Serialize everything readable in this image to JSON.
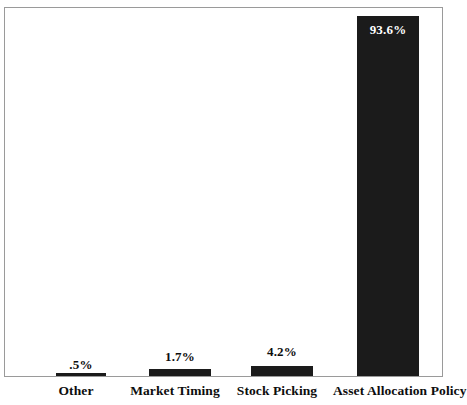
{
  "chart_data": {
    "type": "bar",
    "title": "",
    "subtitle": "",
    "xlabel": "",
    "ylabel": "",
    "grid": false,
    "legend": false,
    "ylim": [
      0,
      100
    ],
    "categories": [
      "Other",
      "Market Timing",
      "Stock Picking",
      "Asset Allocation Policy"
    ],
    "values": [
      0.5,
      1.7,
      4.2,
      93.6
    ],
    "data_labels": [
      ".5%",
      "1.7%",
      "4.2%",
      "93.6%"
    ],
    "series": [
      {
        "name": "Contribution to Return Variation",
        "values": [
          0.5,
          1.7,
          4.2,
          93.6
        ]
      }
    ],
    "bar_color": "#1b1b1b",
    "label_color_outside": "#0d0d0d",
    "label_color_inside": "#ffffff",
    "frame_color": "#9a9a9a",
    "background": "#ffffff"
  },
  "bars": [
    {
      "category": "Other",
      "data_label": ".5%",
      "value": 0.5,
      "label_inside": false,
      "left_px": 51,
      "width_px": 50,
      "height_px": 3,
      "label_top_px": 357,
      "cat_left_px": 26,
      "cat_width_px": 100
    },
    {
      "category": "Market Timing",
      "data_label": "1.7%",
      "value": 1.7,
      "label_inside": false,
      "left_px": 144,
      "width_px": 62,
      "height_px": 7,
      "label_top_px": 349,
      "cat_left_px": 113,
      "cat_width_px": 124
    },
    {
      "category": "Stock Picking",
      "data_label": "4.2%",
      "value": 4.2,
      "label_inside": false,
      "left_px": 246,
      "width_px": 62,
      "height_px": 10,
      "label_top_px": 344,
      "cat_left_px": 216,
      "cat_width_px": 122
    },
    {
      "category": "Asset Allocation Policy",
      "data_label": "93.6%",
      "value": 93.6,
      "label_inside": true,
      "left_px": 352,
      "width_px": 62,
      "height_px": 360,
      "label_top_px": 22,
      "cat_left_px": 333,
      "cat_width_px": 118
    }
  ]
}
